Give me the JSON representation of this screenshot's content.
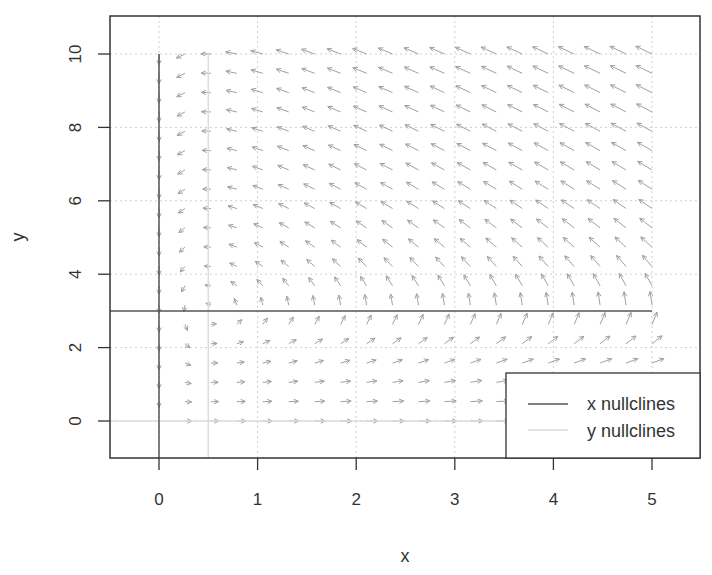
{
  "chart_data": {
    "type": "vector_field",
    "title": "",
    "xlabel": "x",
    "ylabel": "y",
    "xlim": [
      -0.5,
      5.5
    ],
    "ylim": [
      -1.0,
      11.0
    ],
    "x_ticks": [
      0,
      1,
      2,
      3,
      4,
      5
    ],
    "y_ticks": [
      0,
      2,
      4,
      6,
      8,
      10
    ],
    "grid": true,
    "legend_position": "bottomright",
    "field": {
      "dx_expr": "x*(3 - y)",
      "dy_expr": "y*(x - 0.5)",
      "x_range": [
        0,
        5
      ],
      "y_range": [
        0,
        10
      ],
      "points_per_axis": 20,
      "arrow_color": "#a0a0a0"
    },
    "series": [
      {
        "name": "x nullclines",
        "color": "#555555",
        "lines": [
          {
            "type": "vertical",
            "x": 0,
            "y_from": -1.0,
            "y_to": 10
          },
          {
            "type": "horizontal",
            "y": 3,
            "x_from": -0.5,
            "x_to": 5
          }
        ]
      },
      {
        "name": "y nullclines",
        "color": "#dcdcdc",
        "lines": [
          {
            "type": "vertical",
            "x": 0.5,
            "y_from": -1.0,
            "y_to": 10
          },
          {
            "type": "horizontal",
            "y": 0,
            "x_from": -0.5,
            "x_to": 5
          }
        ]
      }
    ],
    "legend": [
      "x nullclines",
      "y nullclines"
    ]
  },
  "axes": {
    "x_title": "x",
    "y_title": "y",
    "x_tick_labels": [
      "0",
      "1",
      "2",
      "3",
      "4",
      "5"
    ],
    "y_tick_labels": [
      "0",
      "2",
      "4",
      "6",
      "8",
      "10"
    ]
  },
  "legend": {
    "items": [
      {
        "label": "x nullclines",
        "color": "#555555"
      },
      {
        "label": "y nullclines",
        "color": "#dcdcdc"
      }
    ]
  }
}
